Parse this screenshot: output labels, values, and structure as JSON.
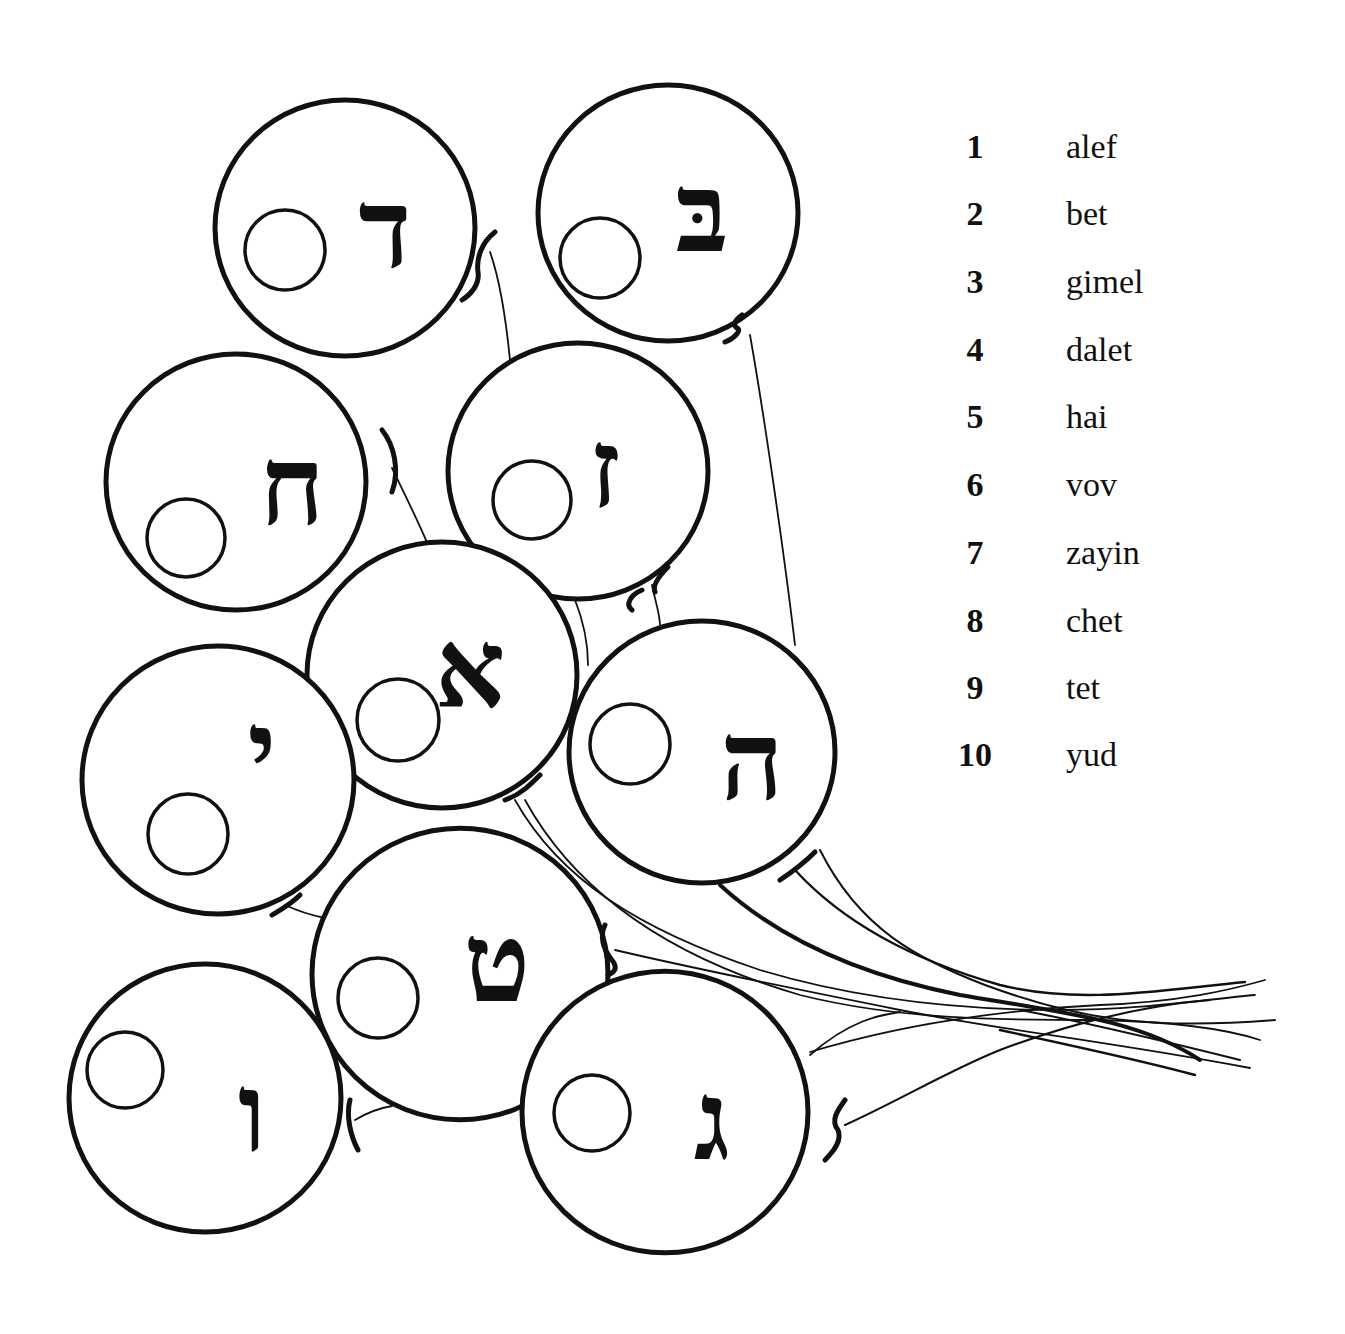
{
  "diagram": {
    "type": "balloon-cluster",
    "balloons": [
      {
        "letter": "ד",
        "name": "dalet",
        "cx": 345,
        "cy": 228,
        "r": 130,
        "lx": 385,
        "ly": 238,
        "sx": 285,
        "sy": 250,
        "sr": 40
      },
      {
        "letter": "בּ",
        "name": "bet",
        "cx": 668,
        "cy": 213,
        "r": 130,
        "lx": 702,
        "ly": 222,
        "sx": 600,
        "sy": 258,
        "sr": 40
      },
      {
        "letter": "ח",
        "name": "chet",
        "cx": 236,
        "cy": 482,
        "r": 130,
        "lx": 292,
        "ly": 495,
        "sx": 186,
        "sy": 538,
        "sr": 39
      },
      {
        "letter": "ז",
        "name": "zayin",
        "cx": 578,
        "cy": 471,
        "r": 130,
        "lx": 605,
        "ly": 478,
        "sx": 532,
        "sy": 500,
        "sr": 39
      },
      {
        "letter": "א",
        "name": "alef",
        "cx": 442,
        "cy": 675,
        "r": 135,
        "lx": 470,
        "ly": 678,
        "sx": 398,
        "sy": 720,
        "sr": 41
      },
      {
        "letter": "י",
        "name": "yud",
        "cx": 218,
        "cy": 780,
        "r": 136,
        "lx": 262,
        "ly": 760,
        "sx": 188,
        "sy": 834,
        "sr": 40
      },
      {
        "letter": "ה",
        "name": "hai",
        "cx": 702,
        "cy": 752,
        "r": 133,
        "lx": 752,
        "ly": 770,
        "sx": 630,
        "sy": 744,
        "sr": 40
      },
      {
        "letter": "ט",
        "name": "tet",
        "cx": 460,
        "cy": 974,
        "r": 148,
        "lx": 497,
        "ly": 972,
        "sx": 378,
        "sy": 998,
        "sr": 40
      },
      {
        "letter": "ו",
        "name": "vov",
        "cx": 205,
        "cy": 1098,
        "r": 136,
        "lx": 252,
        "ly": 1122,
        "sx": 125,
        "sy": 1070,
        "sr": 38
      },
      {
        "letter": "ג",
        "name": "gimel",
        "cx": 665,
        "cy": 1112,
        "r": 143,
        "lx": 712,
        "ly": 1130,
        "sx": 592,
        "sy": 1113,
        "sr": 38
      }
    ]
  },
  "legend": {
    "items": [
      {
        "number": "1",
        "name": "alef"
      },
      {
        "number": "2",
        "name": "bet"
      },
      {
        "number": "3",
        "name": "gimel"
      },
      {
        "number": "4",
        "name": "dalet"
      },
      {
        "number": "5",
        "name": "hai"
      },
      {
        "number": "6",
        "name": "vov"
      },
      {
        "number": "7",
        "name": "zayin"
      },
      {
        "number": "8",
        "name": "chet"
      },
      {
        "number": "9",
        "name": "tet"
      },
      {
        "number": "10",
        "name": "yud"
      }
    ]
  }
}
